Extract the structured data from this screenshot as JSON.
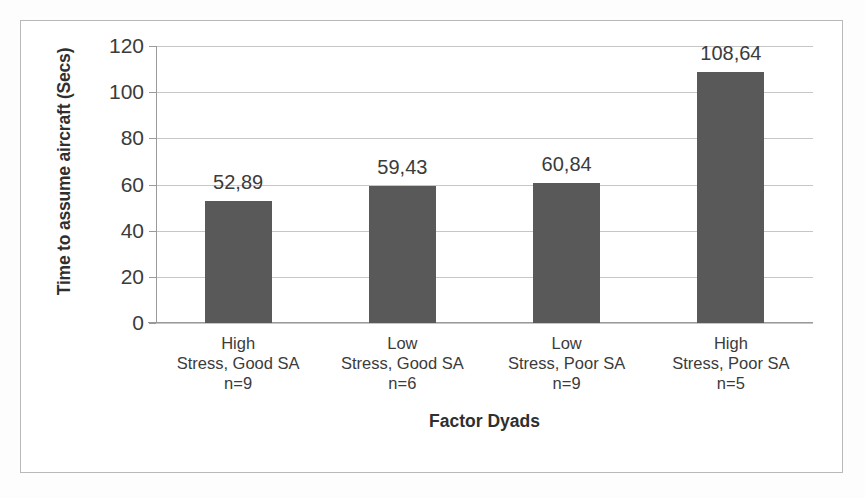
{
  "chart_data": {
    "type": "bar",
    "title": "",
    "xlabel": "Factor Dyads",
    "ylabel": "Time to assume aircraft (Secs)",
    "categories": [
      "High\nStress, Good SA\nn=9",
      "Low\nStress, Good SA\nn=6",
      "Low\nStress, Poor SA\nn=9",
      "High\nStress, Poor SA\nn=5"
    ],
    "category_lines": [
      [
        "High",
        "Stress, Good SA",
        "n=9"
      ],
      [
        "Low",
        "Stress, Good SA",
        "n=6"
      ],
      [
        "Low",
        "Stress, Poor SA",
        "n=9"
      ],
      [
        "High",
        "Stress, Poor SA",
        "n=5"
      ]
    ],
    "values": [
      52.89,
      59.43,
      60.84,
      108.64
    ],
    "value_labels": [
      "52,89",
      "59,43",
      "60,84",
      "108,64"
    ],
    "ylim": [
      0,
      120
    ],
    "ytick_values": [
      0,
      20,
      40,
      60,
      80,
      100,
      120
    ],
    "ytick_labels": [
      "0",
      "20",
      "40",
      "60",
      "80",
      "100",
      "120"
    ],
    "grid": true,
    "legend": false,
    "bar_color": "#595959",
    "gridline_color": "#c6c6c6",
    "axis_color": "#9a9a9a",
    "text_color": "#3b3b3b",
    "background_color": "#ffffff",
    "border_color": "#b9b9b9"
  }
}
